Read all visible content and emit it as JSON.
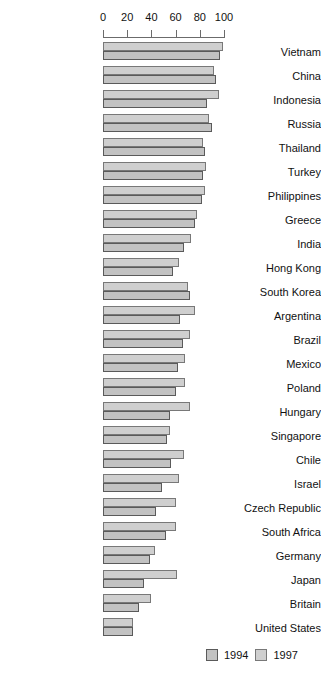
{
  "chart_data": {
    "type": "bar",
    "orientation": "horizontal",
    "title": "",
    "subtitle": "",
    "xlabel": "",
    "ylabel": "",
    "xlim": [
      0,
      100
    ],
    "xticks": [
      0,
      20,
      40,
      60,
      80,
      100
    ],
    "grid": false,
    "legend_position": "bottom-right",
    "categories": [
      "Vietnam",
      "China",
      "Indonesia",
      "Russia",
      "Thailand",
      "Turkey",
      "Philippines",
      "Greece",
      "India",
      "Hong Kong",
      "South Korea",
      "Argentina",
      "Brazil",
      "Mexico",
      "Poland",
      "Hungary",
      "Singapore",
      "Chile",
      "Israel",
      "Czech Republic",
      "South Africa",
      "Germany",
      "Japan",
      "Britain",
      "United States"
    ],
    "series": [
      {
        "name": "1994",
        "color": "#c2c2c2",
        "values": [
          97,
          93,
          86,
          90,
          84,
          83,
          82,
          76,
          67,
          58,
          72,
          64,
          66,
          62,
          60,
          55,
          53,
          56,
          49,
          44,
          52,
          39,
          34,
          30,
          25
        ]
      },
      {
        "name": "1997",
        "color": "#cfcfcf",
        "values": [
          99,
          92,
          96,
          88,
          83,
          85,
          84,
          78,
          73,
          63,
          70,
          76,
          72,
          68,
          68,
          72,
          55,
          67,
          63,
          60,
          60,
          43,
          61,
          40,
          25
        ]
      }
    ]
  },
  "legend": {
    "items": [
      {
        "label": "1994",
        "swatch_class": "swatch-1994"
      },
      {
        "label": "1997",
        "swatch_class": "swatch-1997"
      }
    ]
  },
  "colors": {
    "bar_1994": "#c2c2c2",
    "bar_1997": "#cfcfcf",
    "axis": "#6b6b6b",
    "text": "#111111",
    "background": "#ffffff"
  }
}
